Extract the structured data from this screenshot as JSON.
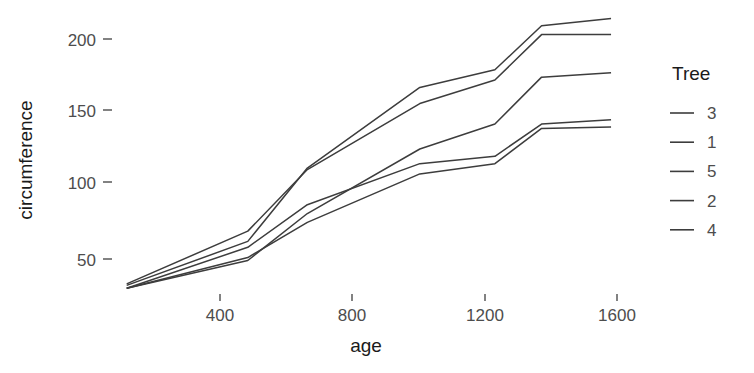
{
  "chart_data": {
    "type": "line",
    "title": "",
    "subtitle": "",
    "xlabel": "age",
    "ylabel": "circumference",
    "xlim": [
      118,
      1582
    ],
    "ylim": [
      26,
      218
    ],
    "grid": false,
    "legend": {
      "title": "Tree",
      "position": "right",
      "entries": [
        "3",
        "1",
        "5",
        "2",
        "4"
      ]
    },
    "x": [
      118,
      484,
      664,
      1004,
      1231,
      1372,
      1582
    ],
    "xticks": [
      400,
      800,
      1200,
      1600
    ],
    "xtick_labels": [
      "400",
      "800",
      "1200",
      "1600"
    ],
    "yticks": [
      50,
      100,
      150,
      200
    ],
    "ytick_labels": [
      "50",
      "100",
      "150",
      "200"
    ],
    "series": [
      {
        "name": "3",
        "values": [
          30,
          51,
          75,
          108,
          115,
          139,
          140
        ]
      },
      {
        "name": "1",
        "values": [
          30,
          58,
          87,
          115,
          120,
          142,
          145
        ]
      },
      {
        "name": "5",
        "values": [
          30,
          49,
          81,
          125,
          142,
          174,
          177
        ]
      },
      {
        "name": "2",
        "values": [
          33,
          69,
          111,
          156,
          172,
          203,
          203
        ]
      },
      {
        "name": "4",
        "values": [
          32,
          62,
          112,
          167,
          179,
          209,
          214
        ]
      }
    ],
    "series_color": "#3d3d3d",
    "background_color": "#ffffff",
    "text_color": "#4d4d4d",
    "title_color": "#1a1a1a"
  }
}
